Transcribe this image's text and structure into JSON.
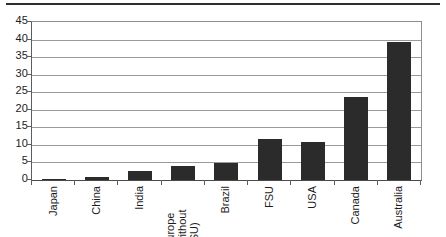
{
  "figure": {
    "top_rule": "horizontal-rule",
    "axis_line_color": "#5d5d5d",
    "gridline_color": "#9a9a9a",
    "bar_color": "#2b2b2b"
  },
  "chart_data": {
    "type": "bar",
    "title": "",
    "subtitle": "",
    "xlabel": "",
    "ylabel": "",
    "categories": [
      "Japan",
      "China",
      "India",
      "Europe (without FSU)",
      "Brazil",
      "FSU",
      "USA",
      "Canada",
      "Australia"
    ],
    "category_labels_multiline": [
      [
        "Japan"
      ],
      [
        "China"
      ],
      [
        "India"
      ],
      [
        "Europe",
        "(without",
        "FSU)"
      ],
      [
        "Brazil"
      ],
      [
        "FSU"
      ],
      [
        "USA"
      ],
      [
        "Canada"
      ],
      [
        "Australia"
      ]
    ],
    "values": [
      0.4,
      1.0,
      2.7,
      3.9,
      4.8,
      11.8,
      10.9,
      23.7,
      39.3
    ],
    "ylim": [
      0,
      45
    ],
    "ytick_labels": [
      "0",
      "5",
      "10",
      "15",
      "20",
      "25",
      "30",
      "35",
      "40",
      "45"
    ],
    "ytick_values": [
      0,
      5,
      10,
      15,
      20,
      25,
      30,
      35,
      40,
      45
    ],
    "ytick_step": 5,
    "grid": true,
    "grid_axis": "y",
    "legend": false,
    "legend_position": "none",
    "label_rotation": -90,
    "series": [
      {
        "name": "",
        "values": [
          0.4,
          1.0,
          2.7,
          3.9,
          4.8,
          11.8,
          10.9,
          23.7,
          39.3
        ]
      }
    ]
  }
}
